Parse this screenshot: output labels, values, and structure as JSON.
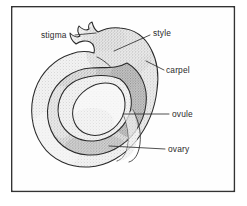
{
  "figure": {
    "kind": "botanical-diagram",
    "subject": "carpel",
    "caption": "",
    "frame": {
      "border_color": "#333333",
      "background_color": "#fefefe",
      "x": 11,
      "y": 6,
      "width": 224,
      "height": 186
    },
    "palette": {
      "outline": "#2a2a2a",
      "label_text": "#2b2b2b",
      "leader_line": "#303030",
      "carpel_fill": "#ededed",
      "ovary_wall_fill": "#c9c9c9",
      "ovary_wall_dark_fill": "#9a9a9a",
      "ovule_fill": "#f4f4f4",
      "stipple": "#8a8a8a"
    },
    "labels": [
      {
        "id": "stigma",
        "text": "stigma",
        "text_x": 41,
        "text_y": 38,
        "anchor": "start",
        "leader": "M 75 35 L 96 33",
        "points_to": "jagged stigma tip at top-left of style"
      },
      {
        "id": "style",
        "text": "style",
        "text_x": 153,
        "text_y": 36,
        "anchor": "start",
        "leader": "M 150 35 L 114 51",
        "points_to": "elongated neck of the carpel"
      },
      {
        "id": "carpel",
        "text": "carpel",
        "text_x": 166,
        "text_y": 73,
        "anchor": "start",
        "leader": "M 164 70 L 148 62",
        "points_to": "whole outer structure wall"
      },
      {
        "id": "ovule",
        "text": "ovule",
        "text_x": 172,
        "text_y": 117,
        "anchor": "start",
        "leader": "M 169 114 L 125 114",
        "points_to": "light oval body inside the ovary"
      },
      {
        "id": "ovary",
        "text": "ovary",
        "text_x": 168,
        "text_y": 152,
        "anchor": "start",
        "leader": "M 165 149 L 110 147",
        "points_to": "coiled chamber enclosing the ovule"
      }
    ],
    "shapes": {
      "carpel_outline": "M 98 32 C 104 29 112 27 120 28 C 134 29 145 37 151 49 C 158 62 159 76 157 90 C 155 108 148 126 136 141 C 124 156 107 166 89 167 C 70 168 52 160 42 145 C 31 129 29 108 35 90 C 41 72 55 59 71 54 C 79 51 87 51 94 53 C 95 49 94 44 90 42 C 86 40 80 41 76 44 C 72 41 70 37 70 33 C 73 36 77 38 80 36 C 78 33 77 29 79 26 C 82 29 86 31 89 29 C 88 26 89 23 92 22 C 93 26 95 30 98 32 Z",
      "style_groove": "M 97 57 C 104 60 112 67 117 75",
      "ovary_wall_outer": "M 127 63 C 141 71 148 87 146 104 C 144 123 132 140 115 149 C 98 158 77 157 63 146 C 49 135 44 115 50 98 C 56 81 73 69 91 68 C 104 67 117 69 127 63 Z",
      "ovary_wall_inner": "M 120 79 C 131 87 134 102 129 115 C 123 130 109 140 94 141 C 79 142 65 134 60 121 C 55 107 60 91 72 83 C 84 75 106 73 120 79 Z",
      "ovule": "M 118 87 C 127 95 127 110 120 121 C 112 133 98 138 87 134 C 75 130 70 117 74 105 C 79 92 93 83 105 83 C 110 83 115 84 118 87 Z",
      "ovary_tail_left": "M 125 118 C 128 127 130 138 128 148 C 126 155 122 159 118 160",
      "ovary_tail_right": "M 133 112 C 139 124 141 137 138 149 C 136 157 132 161 128 162"
    }
  }
}
